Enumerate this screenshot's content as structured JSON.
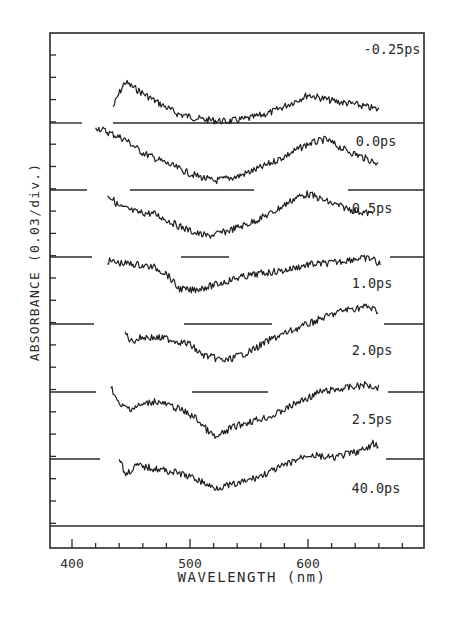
{
  "chart_data": {
    "type": "line",
    "title": "",
    "xlabel": "WAVELENGTH (nm)",
    "ylabel": "ABSORBANCE (0.03/div.)",
    "xlim": [
      382,
      700
    ],
    "x_ticks": [
      400,
      500,
      600
    ],
    "x_minor_step": 20,
    "y_scale_per_div": 0.03,
    "grid": false,
    "legend": "inline labels at right of each trace",
    "offset_note": "Traces vertically offset; each has its own dashed baseline (zero absorbance).",
    "series": [
      {
        "name": "-0.25ps",
        "x": [
          435,
          440,
          445,
          455,
          470,
          490,
          510,
          530,
          550,
          570,
          590,
          600,
          620,
          640,
          660
        ],
        "y": [
          0.022,
          0.04,
          0.055,
          0.045,
          0.03,
          0.012,
          0.005,
          0.002,
          0.006,
          0.015,
          0.03,
          0.038,
          0.03,
          0.025,
          0.018
        ]
      },
      {
        "name": "0.0ps",
        "x": [
          420,
          430,
          445,
          460,
          480,
          500,
          520,
          540,
          560,
          580,
          600,
          615,
          630,
          645,
          660
        ],
        "y": [
          0.085,
          0.078,
          0.068,
          0.05,
          0.036,
          0.022,
          0.012,
          0.018,
          0.03,
          0.045,
          0.062,
          0.068,
          0.055,
          0.045,
          0.035
        ]
      },
      {
        "name": "0.5ps",
        "x": [
          430,
          440,
          455,
          470,
          490,
          505,
          515,
          530,
          550,
          570,
          590,
          600,
          620,
          640,
          655
        ],
        "y": [
          0.085,
          0.068,
          0.06,
          0.058,
          0.042,
          0.032,
          0.028,
          0.034,
          0.045,
          0.06,
          0.08,
          0.085,
          0.072,
          0.062,
          0.058
        ]
      },
      {
        "name": "1.0ps",
        "x": [
          430,
          440,
          455,
          470,
          480,
          490,
          500,
          520,
          540,
          560,
          580,
          600,
          620,
          640,
          655,
          662
        ],
        "y": [
          0.085,
          0.082,
          0.08,
          0.076,
          0.068,
          0.048,
          0.045,
          0.052,
          0.062,
          0.068,
          0.072,
          0.08,
          0.082,
          0.088,
          0.088,
          0.078
        ]
      },
      {
        "name": "2.0ps",
        "x": [
          445,
          450,
          460,
          480,
          500,
          510,
          520,
          530,
          550,
          570,
          590,
          610,
          630,
          650,
          660
        ],
        "y": [
          0.08,
          0.068,
          0.074,
          0.072,
          0.064,
          0.05,
          0.046,
          0.042,
          0.054,
          0.072,
          0.085,
          0.098,
          0.11,
          0.115,
          0.108
        ]
      },
      {
        "name": "2.5ps",
        "x": [
          433,
          440,
          450,
          470,
          490,
          505,
          515,
          522,
          535,
          550,
          570,
          590,
          610,
          630,
          650,
          660
        ],
        "y": [
          0.098,
          0.072,
          0.068,
          0.078,
          0.068,
          0.055,
          0.038,
          0.028,
          0.042,
          0.05,
          0.058,
          0.075,
          0.09,
          0.095,
          0.1,
          0.096
        ]
      },
      {
        "name": "40.0ps",
        "x": [
          440,
          445,
          455,
          470,
          490,
          505,
          520,
          540,
          560,
          580,
          600,
          620,
          640,
          650,
          655,
          660
        ],
        "y": [
          0.092,
          0.068,
          0.08,
          0.076,
          0.07,
          0.062,
          0.05,
          0.055,
          0.066,
          0.08,
          0.095,
          0.09,
          0.098,
          0.102,
          0.11,
          0.104
        ]
      }
    ]
  },
  "labels": {
    "xlabel": "WAVELENGTH (nm)",
    "ylabel": "ABSORBANCE (0.03/div.)",
    "x_ticks": [
      "400",
      "500",
      "600"
    ],
    "traces": [
      "-0.25ps",
      "0.0ps",
      "0.5ps",
      "1.0ps",
      "2.0ps",
      "2.5ps",
      "40.0ps"
    ]
  }
}
